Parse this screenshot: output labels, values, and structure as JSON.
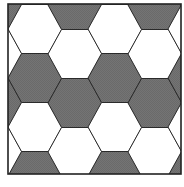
{
  "diagram": {
    "tiling": "flat-top hexagons",
    "colors": {
      "shaded": "#707070",
      "white": "#ffffff",
      "stroke": "#2a2a2a",
      "frame": "#222222"
    },
    "columns": [
      {
        "col": -1,
        "cells": [
          "shaded",
          "white",
          "shaded",
          "white",
          "shaded"
        ]
      },
      {
        "col": 0,
        "cells": [
          "white",
          "shaded",
          "white",
          "shaded"
        ]
      },
      {
        "col": 1,
        "cells": [
          "shaded",
          "white",
          "shaded",
          "white",
          "shaded"
        ]
      },
      {
        "col": 2,
        "cells": [
          "white",
          "shaded",
          "white",
          "shaded"
        ]
      },
      {
        "col": 3,
        "cells": [
          "shaded",
          "white",
          "shaded",
          "white",
          "shaded"
        ]
      },
      {
        "col": 4,
        "cells": [
          "white",
          "shaded",
          "white",
          "shaded"
        ]
      }
    ]
  }
}
